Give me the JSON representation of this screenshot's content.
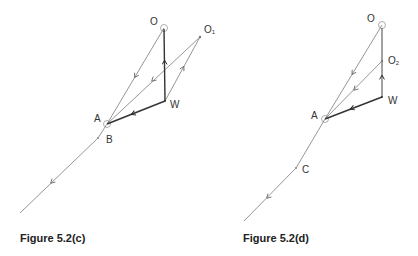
{
  "figures": [
    {
      "id": "c",
      "caption": "Figure 5.2(c)",
      "points": {
        "O": {
          "label": "O",
          "x": 164,
          "y": 28
        },
        "O1": {
          "label": "O",
          "sub": "1",
          "x": 200,
          "y": 37
        },
        "W": {
          "label": "W",
          "x": 165,
          "y": 101
        },
        "A": {
          "label": "A",
          "x": 107,
          "y": 124
        },
        "B": {
          "label": "B",
          "x": 100,
          "y": 136
        }
      },
      "track_end": {
        "x": 20,
        "y": 213
      }
    },
    {
      "id": "d",
      "caption": "Figure 5.2(d)",
      "points": {
        "O": {
          "label": "O",
          "x": 382,
          "y": 25
        },
        "O2": {
          "label": "O",
          "sub": "2",
          "x": 382,
          "y": 61
        },
        "W": {
          "label": "W",
          "x": 382,
          "y": 97
        },
        "A": {
          "label": "A",
          "x": 325,
          "y": 119
        },
        "C": {
          "label": "C",
          "x": 297,
          "y": 168
        }
      },
      "track_end": {
        "x": 244,
        "y": 221
      }
    }
  ],
  "colors": {
    "thin_line": "#8a8a8a",
    "thick_line": "#333333",
    "text": "#333333"
  }
}
